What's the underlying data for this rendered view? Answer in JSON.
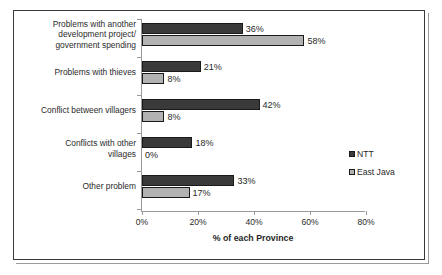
{
  "chart_data": {
    "type": "bar",
    "orientation": "horizontal",
    "title": "",
    "xlabel": "% of each Province",
    "ylabel": "",
    "xlim": [
      0,
      80
    ],
    "xticks": [
      "0%",
      "20%",
      "40%",
      "60%",
      "80%"
    ],
    "xtick_values": [
      0,
      20,
      40,
      60,
      80
    ],
    "grid": false,
    "legend_position": "right",
    "categories": [
      "Problems with another development project/ government spending",
      "Problems with thieves",
      "Conflict between villagers",
      "Conflicts with other villages",
      "Other problem"
    ],
    "category_lines": [
      [
        "Problems with another",
        "development project/",
        "government spending"
      ],
      [
        "Problems with thieves"
      ],
      [
        "Conflict between villagers"
      ],
      [
        "Conflicts with other",
        "villages"
      ],
      [
        "Other problem"
      ]
    ],
    "series": [
      {
        "name": "NTT",
        "color": "#3a3a3a",
        "values": [
          36,
          21,
          42,
          18,
          33
        ],
        "labels": [
          "36%",
          "21%",
          "42%",
          "18%",
          "33%"
        ]
      },
      {
        "name": "East Java",
        "color": "#b2b2b2",
        "values": [
          58,
          8,
          8,
          0,
          17
        ],
        "labels": [
          "58%",
          "8%",
          "8%",
          "0%",
          "17%"
        ]
      }
    ]
  },
  "legend": {
    "items": [
      {
        "label": "NTT",
        "color": "#3a3a3a"
      },
      {
        "label": "East Java",
        "color": "#b2b2b2"
      }
    ]
  },
  "axis": {
    "title": "% of each Province"
  }
}
